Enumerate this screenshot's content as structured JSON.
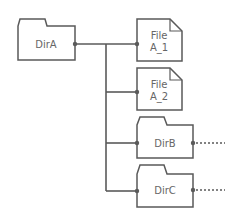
{
  "diagram": {
    "type": "directory-tree",
    "colors": {
      "stroke": "#5a5a5a",
      "text": "#666666",
      "background": "#ffffff"
    },
    "root": {
      "label": "DirA",
      "kind": "folder"
    },
    "children": [
      {
        "label_lines": [
          "File",
          "A_1"
        ],
        "kind": "file"
      },
      {
        "label_lines": [
          "File",
          "A_2"
        ],
        "kind": "file"
      },
      {
        "label": "DirB",
        "kind": "folder",
        "has_more": true
      },
      {
        "label": "DirC",
        "kind": "folder",
        "has_more": true
      }
    ]
  }
}
